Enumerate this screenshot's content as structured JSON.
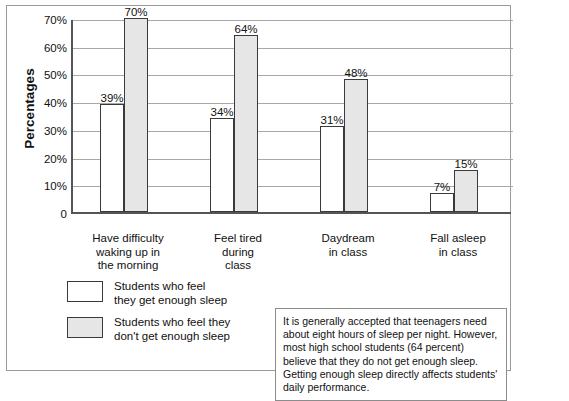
{
  "chart_data": {
    "type": "bar",
    "title": "",
    "xlabel": "",
    "ylabel": "Percentages",
    "ylim": [
      0,
      70
    ],
    "grid": true,
    "legend_position": "below-left",
    "categories": [
      "Have difficulty\nwaking up in\nthe morning",
      "Feel tired\nduring\nclass",
      "Daydream\nin class",
      "Fall asleep\nin class"
    ],
    "series": [
      {
        "name": "Students who feel\nthey get enough sleep",
        "values": [
          39,
          34,
          31,
          7
        ],
        "value_labels": [
          "39%",
          "34%",
          "31%",
          "7%"
        ],
        "color": "#ffffff"
      },
      {
        "name": "Students who feel they\ndon't get enough sleep",
        "values": [
          70,
          64,
          48,
          15
        ],
        "value_labels": [
          "70%",
          "64%",
          "48%",
          "15%"
        ],
        "color": "#e6e6e6"
      }
    ],
    "ytick_labels": [
      "0",
      "10%",
      "20%",
      "30%",
      "40%",
      "50%",
      "60%",
      "70%"
    ],
    "ytick_values": [
      0,
      10,
      20,
      30,
      40,
      50,
      60,
      70
    ]
  },
  "axis": {
    "y_title": "Percentages"
  },
  "legend": {
    "items": [
      {
        "label": "Students who feel\nthey get enough sleep",
        "swatch": "light"
      },
      {
        "label": "Students who feel they\ndon't get enough sleep",
        "swatch": "shaded"
      }
    ]
  },
  "note": {
    "text": "It is generally accepted that teenagers need about eight hours of sleep per night. However, most high school students (64 percent) believe that they do not get enough sleep. Getting enough sleep directly affects students' daily performance."
  },
  "colors": {
    "bar_light": "#ffffff",
    "bar_shaded": "#e6e6e6",
    "bar_outline": "#3a3a3a",
    "axis": "#555555",
    "gridline": "#a8a8a8",
    "frame": "#9a9a9a"
  }
}
